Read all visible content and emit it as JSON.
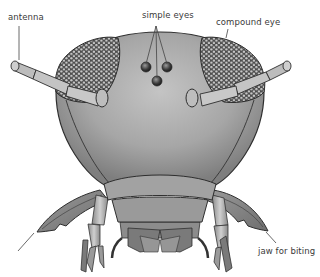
{
  "diagram": {
    "labels": [
      {
        "id": "antenna",
        "text": "antenna",
        "x": 8,
        "y": 13
      },
      {
        "id": "simple-eyes",
        "text": "simple eyes",
        "x": 142,
        "y": 11
      },
      {
        "id": "compound-eye",
        "text": "compound eye",
        "x": 216,
        "y": 18
      },
      {
        "id": "jaw-for-biting",
        "text": "jaw for biting",
        "x": 258,
        "y": 247
      }
    ],
    "colors": {
      "background": "#ffffff",
      "head_fill": "#a8a8a8",
      "head_shade": "#8c8c8c",
      "outline": "#2e2e2e",
      "compound_eye": "#5a5a5a",
      "facet": "#c9c9c9",
      "antenna": "#b8b8b8",
      "label_text": "#3a3a3a",
      "leader_line": "#444444"
    }
  }
}
